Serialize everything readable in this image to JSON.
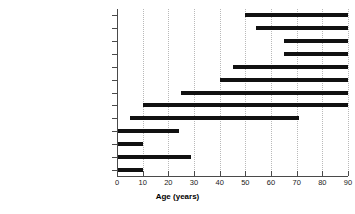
{
  "chart_data": {
    "type": "bar",
    "orientation": "horizontal",
    "style": "range-bar",
    "title": "",
    "xlabel": "Age (years)",
    "ylabel": "",
    "xlim": [
      0,
      90
    ],
    "xticks": [
      0,
      10,
      20,
      30,
      40,
      50,
      60,
      70,
      80,
      90
    ],
    "xticklabels": [
      "0",
      "10",
      "20",
      "30",
      "40",
      "50",
      "60",
      "70",
      "80",
      "90"
    ],
    "grid": "vertical-dotted",
    "legend": "none",
    "categories": [
      "Radiation enteritis",
      "Aorto-enteric fistula",
      "Ischaemic colitis",
      "Angiodysplasia",
      "Diverticulosis",
      "Neoplasms",
      "Drug related",
      "Inflammatory bowel disease",
      "Typhoid fever",
      "Hemangioma",
      "Polyps",
      "Meckel's",
      "Duplication"
    ],
    "ranges": [
      {
        "category": "Radiation enteritis",
        "start": 50,
        "end": 90
      },
      {
        "category": "Aorto-enteric fistula",
        "start": 54,
        "end": 90
      },
      {
        "category": "Ischaemic colitis",
        "start": 65,
        "end": 90
      },
      {
        "category": "Angiodysplasia",
        "start": 65,
        "end": 90
      },
      {
        "category": "Diverticulosis",
        "start": 45,
        "end": 90
      },
      {
        "category": "Neoplasms",
        "start": 40,
        "end": 90
      },
      {
        "category": "Drug related",
        "start": 25,
        "end": 90
      },
      {
        "category": "Inflammatory bowel disease",
        "start": 10,
        "end": 90
      },
      {
        "category": "Typhoid fever",
        "start": 5,
        "end": 71
      },
      {
        "category": "Hemangioma",
        "start": 0,
        "end": 24
      },
      {
        "category": "Polyps",
        "start": 0,
        "end": 10
      },
      {
        "category": "Meckel's",
        "start": 0,
        "end": 29
      },
      {
        "category": "Duplication",
        "start": 0,
        "end": 10
      }
    ],
    "colors": {
      "bar": "#111111",
      "axis": "#4a4a4a",
      "grid": "#b9b9b9",
      "text": "#111111",
      "background": "#ffffff"
    }
  }
}
